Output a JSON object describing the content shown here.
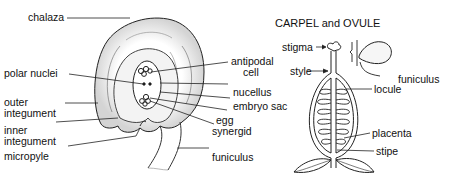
{
  "ovule": {
    "labels": {
      "chalaza": "chalaza",
      "antipodal_cell_1": "antipodal",
      "antipodal_cell_2": "cell",
      "polar_nuclei": "polar nuclei",
      "nucellus": "nucellus",
      "embryo_sac": "embryo sac",
      "outer_integument_1": "outer",
      "outer_integument_2": "integument",
      "egg": "egg",
      "inner_integument_1": "inner",
      "inner_integument_2": "integument",
      "synergid": "synergid",
      "micropyle": "micropyle",
      "funiculus": "funiculus"
    }
  },
  "carpel": {
    "title": "CARPEL and OVULE",
    "labels": {
      "stigma": "stigma",
      "style": "style",
      "funiculus": "funiculus",
      "locule": "locule",
      "placenta": "placenta",
      "stipe": "stipe"
    }
  },
  "colors": {
    "ink": "#111111",
    "shade": "#bdbdbd",
    "background": "#ffffff"
  }
}
